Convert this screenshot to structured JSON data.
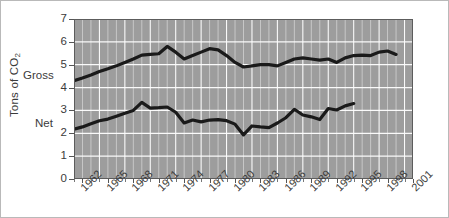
{
  "chart_data": {
    "type": "line",
    "title": "",
    "xlabel": "",
    "ylabel": "Tons of CO2",
    "ylabel_text": "Tons of CO",
    "ylabel_sub": "2",
    "ylim": [
      0,
      7
    ],
    "yticks": [
      0,
      1,
      2,
      3,
      4,
      5,
      6,
      7
    ],
    "xlim": [
      1961,
      2001
    ],
    "xticks": [
      1962,
      1965,
      1968,
      1971,
      1974,
      1977,
      1980,
      1983,
      1986,
      1989,
      1992,
      1995,
      1998,
      2001
    ],
    "xtick_labels": [
      "1962",
      "1965",
      "1968",
      "1971",
      "1974",
      "1977",
      "1980",
      "1983",
      "1986",
      "1989",
      "1992",
      "1995",
      "1998",
      "2001"
    ],
    "grid": true,
    "grid_color": "#ffffff",
    "plot_bgcolor": "#9d9d9d",
    "line_color": "#1a1a1a",
    "legend_position": "inline-left",
    "series": [
      {
        "name": "Gross",
        "label": "Gross",
        "x": [
          1961,
          1962,
          1963,
          1964,
          1965,
          1966,
          1967,
          1968,
          1969,
          1970,
          1971,
          1972,
          1973,
          1974,
          1975,
          1976,
          1977,
          1978,
          1979,
          1980,
          1981,
          1982,
          1983,
          1984,
          1985,
          1986,
          1987,
          1988,
          1989,
          1990,
          1991,
          1992,
          1993,
          1994,
          1995,
          1996,
          1997,
          1998,
          1999
        ],
        "values": [
          4.3,
          4.42,
          4.55,
          4.7,
          4.82,
          4.95,
          5.1,
          5.25,
          5.42,
          5.45,
          5.48,
          5.8,
          5.55,
          5.25,
          5.4,
          5.55,
          5.7,
          5.65,
          5.4,
          5.1,
          4.9,
          4.95,
          5.0,
          5.0,
          4.95,
          5.1,
          5.25,
          5.3,
          5.25,
          5.2,
          5.25,
          5.1,
          5.3,
          5.4,
          5.42,
          5.4,
          5.55,
          5.6,
          5.45
        ]
      },
      {
        "name": "Net",
        "label": "Net",
        "x": [
          1961,
          1962,
          1963,
          1964,
          1965,
          1966,
          1967,
          1968,
          1969,
          1970,
          1971,
          1972,
          1973,
          1974,
          1975,
          1976,
          1977,
          1978,
          1979,
          1980,
          1981,
          1982,
          1983,
          1984,
          1985,
          1986,
          1987,
          1988,
          1989,
          1990,
          1991,
          1992,
          1993,
          1994
        ],
        "values": [
          2.18,
          2.28,
          2.42,
          2.55,
          2.62,
          2.75,
          2.88,
          3.0,
          3.35,
          3.1,
          3.12,
          3.15,
          2.92,
          2.45,
          2.58,
          2.5,
          2.58,
          2.6,
          2.55,
          2.4,
          1.93,
          2.32,
          2.28,
          2.25,
          2.45,
          2.68,
          3.05,
          2.8,
          2.72,
          2.6,
          3.08,
          3.02,
          3.2,
          3.3
        ]
      }
    ]
  },
  "annotations": {
    "gross_inline_label": "Gross",
    "net_inline_label": "Net"
  }
}
